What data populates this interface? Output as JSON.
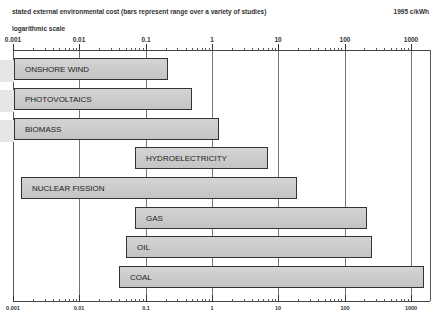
{
  "header": {
    "title": "stated external environmental cost (bars represent range over a variety of studies)",
    "unit": "1995  c/kWh",
    "scale_note": "logarithmic scale"
  },
  "axis": {
    "tick_labels": [
      "0.001",
      "0.01",
      "0.1",
      "1",
      "10",
      "100",
      "1000"
    ]
  },
  "bars": [
    {
      "label": "ONSHORE WIND"
    },
    {
      "label": "PHOTOVOLTAICS"
    },
    {
      "label": "BIOMASS"
    },
    {
      "label": "HYDROELECTRICITY"
    },
    {
      "label": "NUCLEAR FISSION"
    },
    {
      "label": "GAS"
    },
    {
      "label": "OIL"
    },
    {
      "label": "COAL"
    }
  ],
  "chart_data": {
    "type": "bar",
    "orientation": "horizontal-range",
    "title": "stated external environmental cost (bars represent range over a variety of studies)",
    "subtitle": "logarithmic scale",
    "xlabel": "1995 c/kWh",
    "ylabel": "",
    "xscale": "log",
    "xlim": [
      0.001,
      1500
    ],
    "x_ticks": [
      0.001,
      0.01,
      0.1,
      1,
      10,
      100,
      1000
    ],
    "grid": true,
    "legend": "none",
    "categories": [
      "ONSHORE WIND",
      "PHOTOVOLTAICS",
      "BIOMASS",
      "HYDROELECTRICITY",
      "NUCLEAR FISSION",
      "GAS",
      "OIL",
      "COAL"
    ],
    "series": [
      {
        "name": "low",
        "values": [
          0.001,
          0.001,
          0.001,
          0.07,
          0.0013,
          0.07,
          0.05,
          0.04
        ]
      },
      {
        "name": "high",
        "values": [
          0.22,
          0.5,
          1.3,
          7,
          19,
          220,
          260,
          1600
        ]
      }
    ],
    "bar_color": "#c9c9c9"
  }
}
